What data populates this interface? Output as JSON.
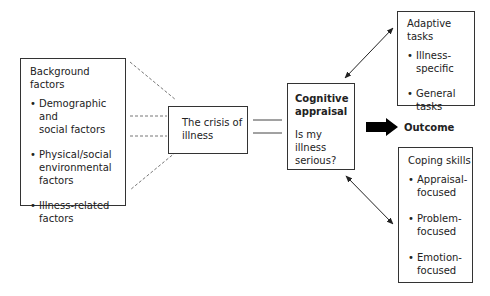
{
  "background_factors": {
    "title": "Background factors",
    "items": [
      {
        "line1": "Demographic and",
        "line2": "social factors"
      },
      {
        "line1": "Physical/social",
        "line2": "environmental",
        "line3": "factors"
      },
      {
        "line1": "Illness-related",
        "line2": "factors"
      }
    ]
  },
  "crisis": {
    "line1": "The crisis of",
    "line2": "illness"
  },
  "cognitive_appraisal": {
    "title_line1": "Cognitive",
    "title_line2": "appraisal",
    "question_line1": "Is my illness",
    "question_line2": "serious?"
  },
  "adaptive_tasks": {
    "title": "Adaptive tasks",
    "items": [
      {
        "line1": "Illness-",
        "line2": "specific"
      },
      {
        "line1": "General",
        "line2": "tasks"
      }
    ]
  },
  "outcome": {
    "label": "Outcome",
    "arrow_color": "#000000"
  },
  "coping_skills": {
    "title": "Coping skills",
    "items": [
      {
        "line1": "Appraisal-",
        "line2": "focused"
      },
      {
        "line1": "Problem-",
        "line2": "focused"
      },
      {
        "line1": "Emotion-",
        "line2": "focused"
      }
    ]
  },
  "colors": {
    "border": "#333333",
    "dashed_line": "#777777",
    "text": "#222222"
  }
}
